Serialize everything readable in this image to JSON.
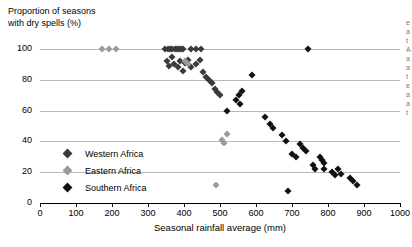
{
  "chart_data": {
    "type": "scatter",
    "title": "",
    "ylabel": "Proportion of seasons\nwith dry spells (%)",
    "xlabel": "Seasonal rainfall average (mm)",
    "xlim": [
      0,
      1000
    ],
    "ylim": [
      0,
      100
    ],
    "xticks": [
      0,
      100,
      200,
      300,
      400,
      500,
      600,
      700,
      800,
      900,
      1000
    ],
    "yticks": [
      0,
      20,
      40,
      60,
      80,
      100
    ],
    "grid": "horizontal",
    "legend_position": "inside-lower-left",
    "series": [
      {
        "name": "Western Africa",
        "color": "#3a3a3a",
        "points": [
          [
            348,
            100
          ],
          [
            355,
            100
          ],
          [
            362,
            100
          ],
          [
            368,
            100
          ],
          [
            374,
            100
          ],
          [
            380,
            100
          ],
          [
            386,
            100
          ],
          [
            392,
            100
          ],
          [
            398,
            100
          ],
          [
            420,
            100
          ],
          [
            432,
            100
          ],
          [
            448,
            100
          ],
          [
            352,
            92
          ],
          [
            358,
            89
          ],
          [
            366,
            95
          ],
          [
            372,
            90
          ],
          [
            384,
            88
          ],
          [
            390,
            92
          ],
          [
            396,
            86
          ],
          [
            404,
            91
          ],
          [
            412,
            93
          ],
          [
            420,
            88
          ],
          [
            432,
            90
          ],
          [
            444,
            93
          ],
          [
            452,
            85
          ],
          [
            462,
            82
          ],
          [
            470,
            80
          ],
          [
            478,
            78
          ],
          [
            486,
            74
          ],
          [
            492,
            72
          ],
          [
            500,
            70
          ]
        ]
      },
      {
        "name": "Eastern Africa",
        "color": "#9a9a9a",
        "points": [
          [
            172,
            100
          ],
          [
            192,
            100
          ],
          [
            212,
            100
          ],
          [
            404,
            92
          ],
          [
            412,
            90
          ],
          [
            505,
            41
          ],
          [
            520,
            45
          ],
          [
            512,
            39
          ],
          [
            490,
            12
          ]
        ]
      },
      {
        "name": "Southern Africa",
        "color": "#111111",
        "points": [
          [
            745,
            100
          ],
          [
            590,
            83
          ],
          [
            520,
            60
          ],
          [
            545,
            67
          ],
          [
            552,
            70
          ],
          [
            560,
            73
          ],
          [
            556,
            64
          ],
          [
            625,
            56
          ],
          [
            640,
            51
          ],
          [
            648,
            49
          ],
          [
            672,
            44
          ],
          [
            684,
            40
          ],
          [
            700,
            32
          ],
          [
            710,
            30
          ],
          [
            722,
            38
          ],
          [
            730,
            36
          ],
          [
            738,
            34
          ],
          [
            758,
            25
          ],
          [
            764,
            22
          ],
          [
            778,
            30
          ],
          [
            784,
            28
          ],
          [
            790,
            26
          ],
          [
            788,
            22
          ],
          [
            812,
            20
          ],
          [
            820,
            18
          ],
          [
            828,
            22
          ],
          [
            836,
            19
          ],
          [
            862,
            16
          ],
          [
            870,
            14
          ],
          [
            880,
            12
          ],
          [
            690,
            8
          ]
        ]
      }
    ]
  },
  "legend": {
    "entries": [
      {
        "label": "Western Africa",
        "key": "west"
      },
      {
        "label": "Eastern Africa",
        "key": "east"
      },
      {
        "label": "Southern Africa",
        "key": "south"
      }
    ]
  },
  "edge_sliver": {
    "text": "e\na\nt\nA\na\na\nt\ne\na\na\nt"
  }
}
